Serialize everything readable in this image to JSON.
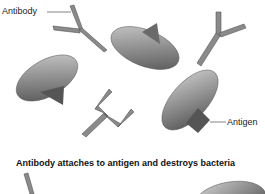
{
  "diagram": {
    "labels": {
      "antibody": "Antibody",
      "antigen": "Antigen"
    },
    "caption": "Antibody attaches to antigen and destroys bacteria",
    "colors": {
      "antibody_fill": "#8a8a8a",
      "antibody_stroke": "#555555",
      "bacteria_light": "#c8c8c8",
      "bacteria_dark": "#555555",
      "leader_line": "#666666"
    }
  }
}
